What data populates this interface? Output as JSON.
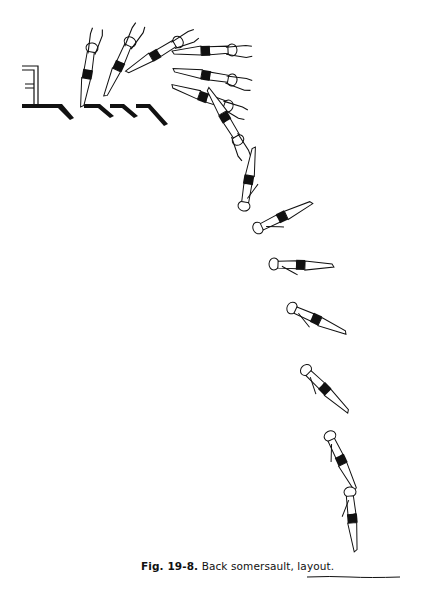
{
  "figure": {
    "number": "Fig. 19-8.",
    "title": "Back somersault, layout.",
    "frames_count": 14,
    "ink_color": "#111111",
    "background": "#ffffff"
  },
  "icons": {
    "diving_board": "diving-board-icon",
    "water_line": "water-surface-icon"
  }
}
